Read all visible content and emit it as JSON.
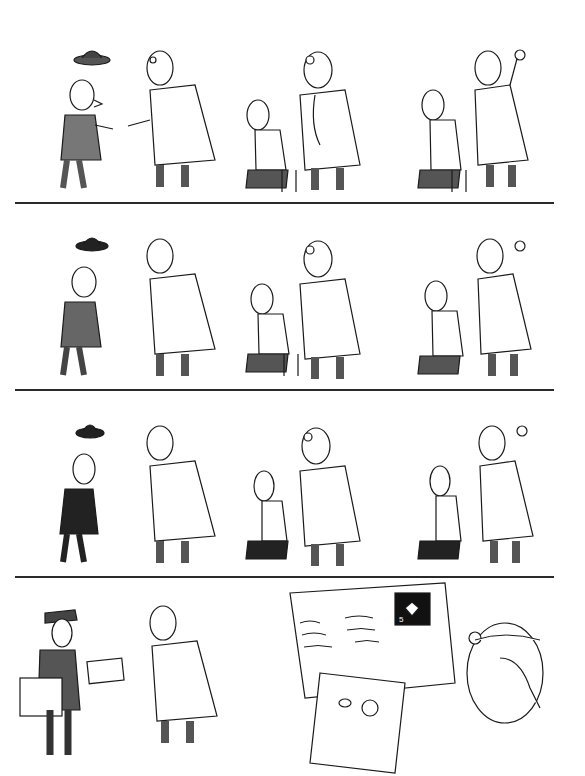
{
  "comic": {
    "title": "",
    "style": "black-and-white pen-and-ink cartoon",
    "rows": [
      {
        "index": 1,
        "panels": [
          {
            "scene": "bald patient in suit tips hat and greets doctor with open hands"
          },
          {
            "scene": "doctor with head mirror listens with stethoscope to seated patient on stool"
          },
          {
            "scene": "doctor taps patient's back, patient says 'ah', doctor makes OK gesture"
          }
        ]
      },
      {
        "index": 2,
        "panels": [
          {
            "scene": "patient in darker suit tips hat and greets doctor"
          },
          {
            "scene": "doctor examines seated patient with stethoscope"
          },
          {
            "scene": "doctor taps patient's back, makes OK gesture"
          }
        ]
      },
      {
        "index": 3,
        "panels": [
          {
            "scene": "thinner patient in black suit tips hat, greets doctor"
          },
          {
            "scene": "doctor examines gaunt seated patient with stethoscope"
          },
          {
            "scene": "doctor taps gaunt patient's back, makes OK gesture"
          }
        ]
      },
      {
        "index": 4,
        "panels": [
          {
            "scene": "postman hands a postcard to the doctor",
            "cap_badge": "POST"
          },
          {
            "scene": "doctor reads postcard showing patient as angel in heaven, covers face in dismay",
            "stamp_value": "5"
          }
        ]
      }
    ],
    "colors": {
      "ink": "#1a1a1a",
      "paper": "#ffffff",
      "divider": "#2a2a2a"
    }
  }
}
